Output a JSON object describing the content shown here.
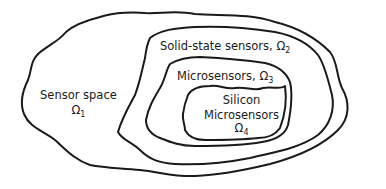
{
  "diagram": {
    "sets": [
      {
        "id": "omega1",
        "label": "Sensor space",
        "symbol": "Ω",
        "subscript": "1"
      },
      {
        "id": "omega2",
        "label": "Solid-state sensors,",
        "symbol": "Ω",
        "subscript": "2"
      },
      {
        "id": "omega3",
        "label": "Microsensors,",
        "symbol": "Ω",
        "subscript": "3"
      },
      {
        "id": "omega4",
        "label_line1": "Silicon",
        "label_line2": "Microsensors",
        "symbol": "Ω",
        "subscript": "4"
      }
    ],
    "relation": "Ω4 ⊂ Ω3 ⊂ Ω2 ⊂ Ω1",
    "colors": {
      "stroke": "#1a1a1a",
      "background": "#ffffff"
    }
  }
}
